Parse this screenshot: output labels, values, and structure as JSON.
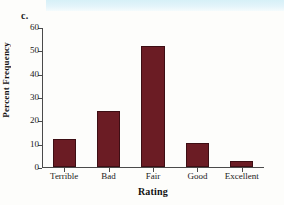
{
  "figure": {
    "panel_label": "c.",
    "bar_color": "#6b1c24",
    "bar_edge_color": "#3d0e14",
    "axis_color": "#4a4a4a",
    "background_color": "#fdfdfb",
    "scan_strip_color": "#d6f0f7"
  },
  "chart_data": {
    "type": "bar",
    "title": "",
    "categories": [
      "Terrible",
      "Bad",
      "Fair",
      "Good",
      "Excellent"
    ],
    "values": [
      12,
      24,
      52,
      10.5,
      2.5
    ],
    "xlabel": "Rating",
    "ylabel": "Percent Frequency",
    "ylim": [
      0,
      60
    ],
    "yticks": [
      0,
      10,
      20,
      30,
      40,
      50,
      60
    ],
    "ytick_labels": [
      "0",
      "10",
      "20",
      "30",
      "40",
      "50",
      "60"
    ],
    "grid": false,
    "legend": false
  }
}
